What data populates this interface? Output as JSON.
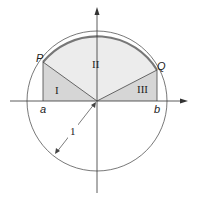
{
  "diagram": {
    "points": {
      "P": "P",
      "Q": "Q"
    },
    "axis_labels": {
      "a": "a",
      "b": "b"
    },
    "regions": {
      "I": "I",
      "II": "II",
      "III": "III"
    },
    "radius_label": "1",
    "colors": {
      "region_I_III": "#d9d9d9",
      "region_II": "#ececec",
      "arc_highlight": "#777777",
      "line": "#444444"
    }
  }
}
